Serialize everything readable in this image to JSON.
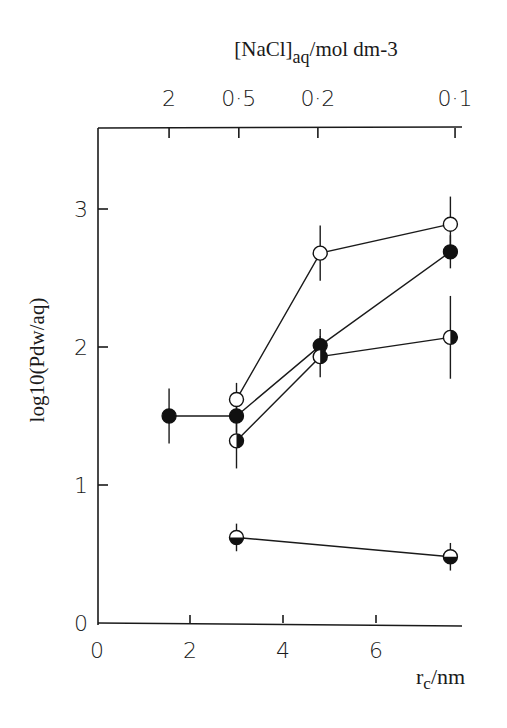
{
  "chart_data": {
    "type": "scatter",
    "title": "",
    "xlabel": "r_c/nm",
    "xlabel_main": "r",
    "xlabel_sub": "c",
    "xlabel_tail": "/nm",
    "ylabel": "log10(Pdw/aq)",
    "top_xlabel": "[NaCl]aq/mol dm-3",
    "top_xlabel_main": "[NaCl]",
    "top_xlabel_sub": "aq",
    "top_xlabel_tail": "/mol dm-3",
    "xlim": [
      0,
      8.1
    ],
    "ylim": [
      0,
      3.6
    ],
    "x_ticks": [
      0,
      2,
      4,
      6
    ],
    "x_tick_labels": [
      "0",
      "2",
      "4",
      "6"
    ],
    "y_ticks": [
      0,
      1,
      2,
      3
    ],
    "y_tick_labels": [
      "0",
      "1",
      "2",
      "3"
    ],
    "top_ticks_rc": [
      1.55,
      3.05,
      4.75,
      7.7
    ],
    "top_tick_labels": [
      "2",
      "0·5",
      "0·2",
      "0·1"
    ],
    "grid": false,
    "legend": "none",
    "series": [
      {
        "name": "open circles",
        "marker": "open",
        "points": [
          {
            "x": 3.0,
            "y": 1.62,
            "err": 0.12
          },
          {
            "x": 4.8,
            "y": 2.68,
            "err": 0.2
          },
          {
            "x": 7.6,
            "y": 2.89,
            "err": 0.2
          }
        ]
      },
      {
        "name": "filled circles",
        "marker": "filled",
        "points": [
          {
            "x": 1.55,
            "y": 1.5,
            "err": 0.2
          },
          {
            "x": 3.0,
            "y": 1.5,
            "err": 0.12
          },
          {
            "x": 4.8,
            "y": 2.01,
            "err": 0.12
          },
          {
            "x": 7.6,
            "y": 2.69,
            "err": 0.12
          }
        ]
      },
      {
        "name": "half-filled (right) circles",
        "marker": "half-right",
        "points": [
          {
            "x": 3.0,
            "y": 1.32,
            "err": 0.2
          },
          {
            "x": 4.8,
            "y": 1.93,
            "err": 0.15
          },
          {
            "x": 7.6,
            "y": 2.07,
            "err": 0.3
          }
        ]
      },
      {
        "name": "half-filled (bottom) circles",
        "marker": "half-bottom",
        "points": [
          {
            "x": 3.0,
            "y": 0.62,
            "err": 0.1
          },
          {
            "x": 7.6,
            "y": 0.48,
            "err": 0.1
          }
        ]
      }
    ]
  }
}
